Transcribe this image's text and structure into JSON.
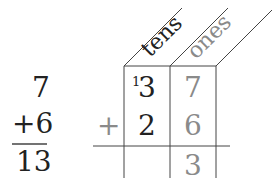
{
  "vertical": {
    "top": "7",
    "bottom": "+6",
    "result": "13"
  },
  "place_value": {
    "headers": {
      "tens": "tens",
      "ones": "ones"
    },
    "carry": "1",
    "row1": {
      "tens": "3",
      "ones": "7"
    },
    "row2": {
      "operator": "+",
      "tens": "2",
      "ones": "6"
    },
    "result": {
      "ones": "3"
    }
  },
  "colors": {
    "dark": "#222222",
    "grey": "#8a8a8a"
  }
}
